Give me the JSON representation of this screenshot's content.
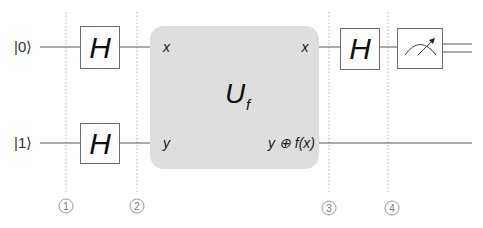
{
  "diagram": {
    "type": "quantum-circuit",
    "inputs": [
      {
        "label": "|0⟩",
        "ket": "0",
        "wire_y": 47
      },
      {
        "label": "|1⟩",
        "ket": "1",
        "wire_y": 143
      }
    ],
    "gates": [
      {
        "id": "h-top-1",
        "label": "H",
        "qubit": 0
      },
      {
        "id": "h-bottom-1",
        "label": "H",
        "qubit": 1
      },
      {
        "id": "h-top-2",
        "label": "H",
        "qubit": 0
      },
      {
        "id": "measure-top",
        "label": "measurement",
        "qubit": 0,
        "icon": "meter-icon"
      }
    ],
    "oracle": {
      "label": "U",
      "subscript": "f",
      "inputs": [
        "x",
        "y"
      ],
      "outputs": [
        "x",
        "y ⊕ f(x)"
      ],
      "fill_color": "#dedede"
    },
    "steps": [
      {
        "number": "1"
      },
      {
        "number": "2"
      },
      {
        "number": "3"
      },
      {
        "number": "4"
      }
    ],
    "output": {
      "top": "classical double wire",
      "bottom": "quantum wire"
    }
  }
}
